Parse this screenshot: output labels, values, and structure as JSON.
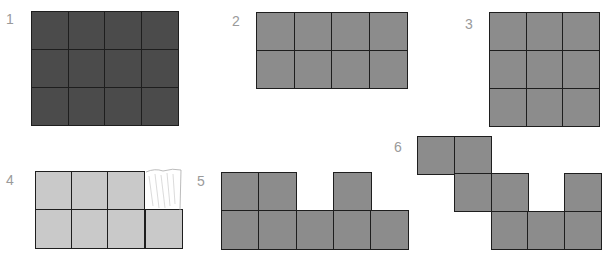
{
  "figures": [
    {
      "label": "1",
      "label_pos": [
        6,
        12
      ],
      "color": "#4b4b4b",
      "cells": [
        [
          31,
          11
        ],
        [
          68,
          11
        ],
        [
          104,
          11
        ],
        [
          141,
          11
        ],
        [
          31,
          49
        ],
        [
          68,
          49
        ],
        [
          104,
          49
        ],
        [
          141,
          49
        ],
        [
          31,
          87
        ],
        [
          68,
          87
        ],
        [
          104,
          87
        ],
        [
          141,
          87
        ]
      ],
      "cell_w": 37,
      "cell_h": 38
    },
    {
      "label": "2",
      "label_pos": [
        232,
        14
      ],
      "color": "#8c8c8c",
      "cells": [
        [
          256,
          12
        ],
        [
          294,
          12
        ],
        [
          331,
          12
        ],
        [
          369,
          12
        ],
        [
          256,
          50
        ],
        [
          294,
          50
        ],
        [
          331,
          50
        ],
        [
          369,
          50
        ]
      ],
      "cell_w": 38,
      "cell_h": 38
    },
    {
      "label": "3",
      "label_pos": [
        465,
        17
      ],
      "color": "#8c8c8c",
      "cells": [
        [
          489,
          12
        ],
        [
          526,
          12
        ],
        [
          562,
          12
        ],
        [
          489,
          50
        ],
        [
          526,
          50
        ],
        [
          562,
          50
        ],
        [
          489,
          88
        ],
        [
          526,
          88
        ],
        [
          562,
          88
        ]
      ],
      "cell_w": 37,
      "cell_h": 38
    },
    {
      "label": "4",
      "label_pos": [
        6,
        173
      ],
      "color": "#c9c9c9",
      "cells": [
        [
          35,
          171
        ],
        [
          71,
          171
        ],
        [
          107,
          171
        ],
        [
          35,
          209
        ],
        [
          71,
          209
        ],
        [
          107,
          209
        ],
        [
          145,
          209
        ]
      ],
      "cell_w": 37,
      "cell_h": 39
    },
    {
      "label": "5",
      "label_pos": [
        197,
        174
      ],
      "color": "#8c8c8c",
      "cells": [
        [
          221,
          172
        ],
        [
          258,
          172
        ],
        [
          333,
          172
        ],
        [
          221,
          210
        ],
        [
          258,
          210
        ],
        [
          296,
          210
        ],
        [
          333,
          210
        ],
        [
          370,
          210
        ]
      ],
      "cell_w": 38,
      "cell_h": 39
    },
    {
      "label": "6",
      "label_pos": [
        394,
        140
      ],
      "color": "#8c8c8c",
      "cells": [
        [
          417,
          136
        ],
        [
          454,
          136
        ],
        [
          454,
          173
        ],
        [
          491,
          173
        ],
        [
          564,
          173
        ],
        [
          491,
          211
        ],
        [
          527,
          211
        ],
        [
          564,
          211
        ]
      ],
      "cell_w": 37,
      "cell_h": 38
    }
  ],
  "labels": {
    "f1": "1",
    "f2": "2",
    "f3": "3",
    "f4": "4",
    "f5": "5",
    "f6": "6"
  }
}
